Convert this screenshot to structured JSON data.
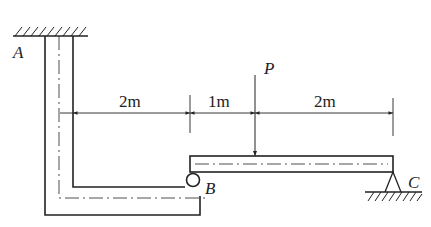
{
  "diagram": {
    "type": "structural-mechanics",
    "labels": {
      "A": "A",
      "B": "B",
      "C": "C",
      "P": "P"
    },
    "dimensions": [
      {
        "id": "d1",
        "label": "2m"
      },
      {
        "id": "d2",
        "label": "1m"
      },
      {
        "id": "d3",
        "label": "2m"
      }
    ],
    "elements": {
      "frame": "L-shaped frame fixed at A (ceiling)",
      "beam": "Horizontal beam B–C",
      "support_B": "roller/hinge connection",
      "support_C": "pin support",
      "load": "Concentrated load P (downward)"
    },
    "colors": {
      "line": "#222222",
      "background": "#ffffff"
    }
  }
}
